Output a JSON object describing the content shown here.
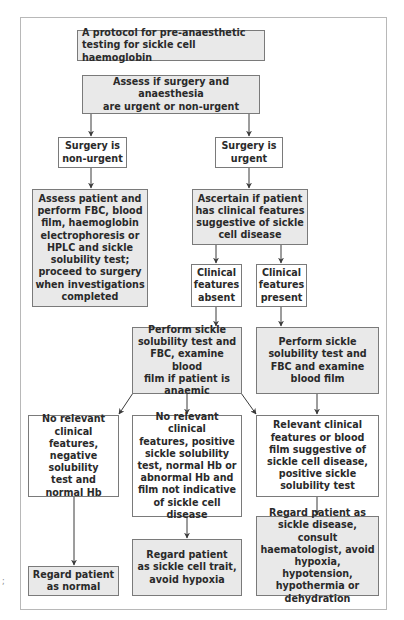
{
  "diagram": {
    "title": "A protocol for pre-anaesthetic\ntesting for sickle cell haemoglobin",
    "nodes": {
      "assess_urgency": "Assess if surgery and anaesthesia\nare urgent or non-urgent",
      "non_urgent": "Surgery is\nnon-urgent",
      "urgent": "Surgery is\nurgent",
      "assess_patient": "Assess patient and\nperform FBC, blood\nfilm, haemoglobin\nelectrophoresis or\nHPLC and sickle\nsolubility test;\nproceed to surgery\nwhen investigations\ncompleted",
      "ascertain": "Ascertain if patient\nhas clinical features\nsuggestive of sickle\ncell disease",
      "features_absent": "Clinical\nfeatures\nabsent",
      "features_present": "Clinical\nfeatures\npresent",
      "perform_if_anaemic": "Perform sickle\nsolubility test and\nFBC, examine blood\nfilm if patient is\nanaemic",
      "perform_blood_film": "Perform sickle\nsolubility test and\nFBC and examine\nblood film",
      "negative_normal": "No relevant\nclinical features,\nnegative\nsolubility\ntest and\nnormal Hb",
      "positive_not_indicative": "No relevant clinical\nfeatures, positive\nsickle solubility\ntest, normal Hb or\nabnormal Hb and\nfilm not indicative\nof sickle cell\ndisease",
      "relevant_positive": "Relevant clinical\nfeatures or blood\nfilm suggestive of\nsickle cell disease,\npositive sickle\nsolubility test",
      "regard_normal": "Regard patient\nas normal",
      "regard_trait": "Regard patient\nas sickle cell trait,\navoid hypoxia",
      "regard_disease": "Regard patient as\nsickle disease, consult\nhaematologist, avoid\nhypoxia, hypotension,\nhypothermia or\ndehydration"
    },
    "edges": [
      [
        "assess_urgency",
        "non_urgent"
      ],
      [
        "assess_urgency",
        "urgent"
      ],
      [
        "non_urgent",
        "assess_patient"
      ],
      [
        "urgent",
        "ascertain"
      ],
      [
        "ascertain",
        "features_absent"
      ],
      [
        "ascertain",
        "features_present"
      ],
      [
        "features_absent",
        "perform_if_anaemic"
      ],
      [
        "features_present",
        "perform_blood_film"
      ],
      [
        "perform_if_anaemic",
        "negative_normal"
      ],
      [
        "perform_if_anaemic",
        "positive_not_indicative"
      ],
      [
        "perform_if_anaemic",
        "relevant_positive"
      ],
      [
        "perform_blood_film",
        "relevant_positive"
      ],
      [
        "negative_normal",
        "regard_normal"
      ],
      [
        "positive_not_indicative",
        "regard_trait"
      ],
      [
        "relevant_positive",
        "regard_disease"
      ]
    ],
    "stray_mark": ";"
  },
  "colors": {
    "grey_fill": "#e9e9e9",
    "white_fill": "#ffffff",
    "border": "#7a7a7a",
    "arrow": "#3a3a3a",
    "text": "#2a2a2a"
  }
}
